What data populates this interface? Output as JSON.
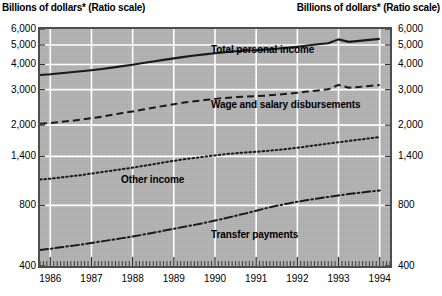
{
  "header": {
    "left_caption": "Billions of dollars* (Ratio scale)",
    "right_caption": "Billions of dollars* (Ratio scale)"
  },
  "axes": {
    "y_ticks": [
      "6,000",
      "5,000",
      "4,000",
      "3,000",
      "2,000",
      "1,400",
      "800",
      "400"
    ],
    "x_ticks": [
      "1986",
      "1987",
      "1988",
      "1989",
      "1990",
      "1991",
      "1992",
      "1993",
      "1994"
    ]
  },
  "series_labels": {
    "total_personal_income": "Total personal income",
    "wage_and_salary": "Wage and salary disbursements",
    "other_income": "Other income",
    "transfer_payments": "Transfer payments"
  },
  "colors": {
    "plot_background": "#b3b3b3",
    "gridline": "#ffffff",
    "line": "#1a1a1a",
    "frame": "#4d4d4d",
    "text": "#000000"
  },
  "chart_data": {
    "type": "line",
    "title": "Billions of dollars* (Ratio scale)",
    "xlabel": "",
    "ylabel": "Billions of dollars",
    "scale": "log",
    "ylim": [
      400,
      6000
    ],
    "xlim": [
      1985.75,
      1994.25
    ],
    "grid": true,
    "legend": "inline-annotations",
    "y_tick_values": [
      6000,
      5000,
      4000,
      3000,
      2000,
      1400,
      800,
      400
    ],
    "x_tick_values": [
      1986,
      1987,
      1988,
      1989,
      1990,
      1991,
      1992,
      1993,
      1994
    ],
    "x": [
      1985.75,
      1986.0,
      1986.25,
      1986.5,
      1986.75,
      1987.0,
      1987.25,
      1987.5,
      1987.75,
      1988.0,
      1988.25,
      1988.5,
      1988.75,
      1989.0,
      1989.25,
      1989.5,
      1989.75,
      1990.0,
      1990.25,
      1990.5,
      1990.75,
      1991.0,
      1991.25,
      1991.5,
      1991.75,
      1992.0,
      1992.25,
      1992.5,
      1992.75,
      1993.0,
      1993.25,
      1993.5,
      1993.75,
      1994.0
    ],
    "series": [
      {
        "name": "Total personal income",
        "style": "solid",
        "values": [
          3550,
          3580,
          3620,
          3660,
          3700,
          3745,
          3800,
          3860,
          3925,
          3990,
          4065,
          4140,
          4215,
          4290,
          4365,
          4430,
          4490,
          4545,
          4600,
          4650,
          4690,
          4710,
          4745,
          4790,
          4840,
          4900,
          4970,
          5040,
          5100,
          5330,
          5180,
          5240,
          5300,
          5360
        ]
      },
      {
        "name": "Wage and salary disbursements",
        "style": "dashed",
        "values": [
          2030,
          2050,
          2075,
          2100,
          2130,
          2165,
          2205,
          2250,
          2295,
          2340,
          2390,
          2440,
          2490,
          2540,
          2590,
          2630,
          2665,
          2700,
          2730,
          2755,
          2775,
          2785,
          2805,
          2830,
          2860,
          2895,
          2935,
          2975,
          3010,
          3170,
          3065,
          3095,
          3130,
          3165
        ]
      },
      {
        "name": "Other income",
        "style": "dotted",
        "values": [
          1075,
          1085,
          1100,
          1115,
          1130,
          1150,
          1170,
          1190,
          1210,
          1230,
          1255,
          1280,
          1305,
          1330,
          1355,
          1375,
          1395,
          1415,
          1435,
          1450,
          1465,
          1475,
          1490,
          1505,
          1525,
          1545,
          1570,
          1595,
          1620,
          1645,
          1670,
          1695,
          1720,
          1745
        ]
      },
      {
        "name": "Transfer payments",
        "style": "dashdot",
        "values": [
          480,
          487,
          495,
          503,
          511,
          520,
          530,
          540,
          550,
          560,
          572,
          585,
          598,
          612,
          626,
          640,
          655,
          672,
          690,
          710,
          730,
          752,
          775,
          796,
          815,
          833,
          850,
          866,
          881,
          896,
          910,
          923,
          936,
          948
        ]
      }
    ]
  }
}
